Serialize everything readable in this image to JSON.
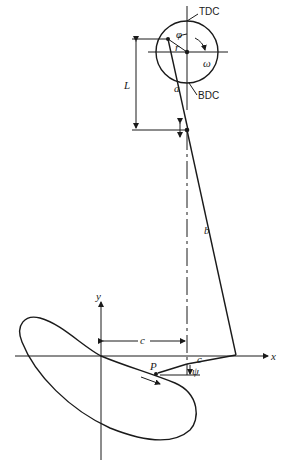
{
  "diagram": {
    "type": "mechanism-linkage",
    "labels": {
      "tdc": "TDC",
      "bdc": "BDC",
      "phi": "φ",
      "r": "r",
      "omega": "ω",
      "a": "a",
      "L": "L",
      "b": "b",
      "c_horizontal": "c",
      "c_small": "c",
      "x_axis": "x",
      "y_axis": "y",
      "point_P": "P",
      "psi": "ψ"
    },
    "colors": {
      "ink": "#1a1a1a",
      "background": "#ffffff"
    }
  }
}
